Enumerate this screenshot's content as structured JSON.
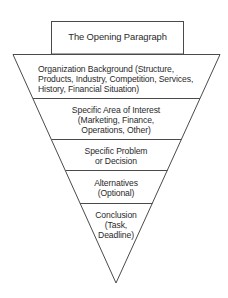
{
  "diagram": {
    "title_box": {
      "label": "The Opening Paragraph"
    },
    "funnel_sections": [
      {
        "label_lines": [
          "Organization Background (Structure,",
          "Products, Industry, Competition, Services,",
          "History, Financial Situation)"
        ]
      },
      {
        "label_lines": [
          "Specific Area of Interest",
          "(Marketing, Finance,",
          "Operations, Other)"
        ]
      },
      {
        "label_lines": [
          "Specific Problem",
          "or Decision"
        ]
      },
      {
        "label_lines": [
          "Alternatives",
          "(Optional)"
        ]
      },
      {
        "label_lines": [
          "Conclusion",
          "(Task,",
          "Deadline)"
        ]
      }
    ],
    "colors": {
      "line": "#4a4a4a",
      "text": "#2a2a2a",
      "background": "#ffffff"
    }
  }
}
